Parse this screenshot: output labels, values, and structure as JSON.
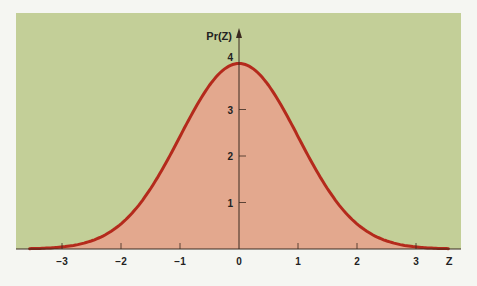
{
  "colors": {
    "page_background": "#f5f6f2",
    "panel_background": "#c3cf98",
    "area_fill": "#e3a88e",
    "curve_stroke": "#b42a1c",
    "axis": "#3a2a20",
    "text": "#222222"
  },
  "chart_data": {
    "type": "area",
    "title": "",
    "xlabel": "Z",
    "ylabel": "Pr(Z)",
    "xlim": [
      -3.55,
      3.55
    ],
    "ylim": [
      0,
      4
    ],
    "x_ticks": [
      -3,
      -2,
      -1,
      0,
      1,
      2,
      3
    ],
    "x_tick_labels": [
      "−3",
      "−2",
      "−1",
      "0",
      "1",
      "2",
      "3"
    ],
    "y_ticks": [
      1,
      2,
      3,
      4
    ],
    "y_tick_labels": [
      "1",
      "2",
      "3",
      "4"
    ],
    "grid": false,
    "legend": null,
    "series": [
      {
        "name": "Standard normal density (scaled ×10)",
        "x": [
          -3.5,
          -3,
          -2.5,
          -2,
          -1.5,
          -1,
          -0.5,
          0,
          0.5,
          1,
          1.5,
          2,
          2.5,
          3,
          3.5
        ],
        "values": [
          0.01,
          0.04,
          0.18,
          0.54,
          1.3,
          2.42,
          3.52,
          3.99,
          3.52,
          2.42,
          1.3,
          0.54,
          0.18,
          0.04,
          0.01
        ]
      }
    ]
  }
}
